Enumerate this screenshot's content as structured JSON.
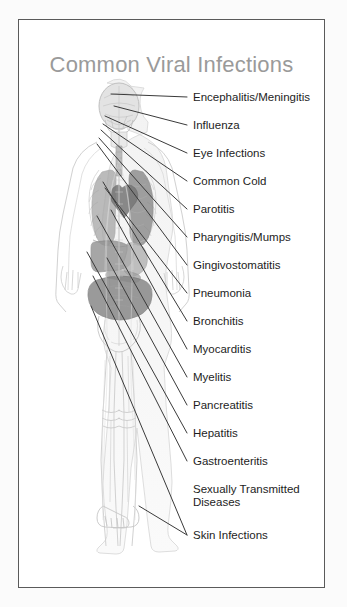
{
  "panel": {
    "title": "Common Viral Infections",
    "border_color": "#5a5a5a",
    "background": "#ffffff",
    "title_color": "#9a9a9a"
  },
  "figure": {
    "description_name": "human-anatomy-figure",
    "style": "semi-transparent grayscale anatomical body, front view, full length",
    "organ_fill": "#8f8f8f",
    "outline_color": "#cfcfcf",
    "skin_tint": "#ededed"
  },
  "leader_lines": {
    "color": "#3a3a3a",
    "width": 1
  },
  "labels": [
    {
      "id": "encephalitis-meningitis",
      "text": "Encephalitis/Meningitis",
      "y": 71,
      "anchor_x": 92,
      "anchor_y": 74,
      "has_leader": true
    },
    {
      "id": "influenza",
      "text": "Influenza",
      "y": 99,
      "anchor_x": 95,
      "anchor_y": 86,
      "has_leader": true
    },
    {
      "id": "eye-infections",
      "text": "Eye Infections",
      "y": 127,
      "anchor_x": 86,
      "anchor_y": 96,
      "has_leader": true
    },
    {
      "id": "common-cold",
      "text": "Common Cold",
      "y": 155,
      "anchor_x": 84,
      "anchor_y": 104,
      "has_leader": true
    },
    {
      "id": "parotitis",
      "text": "Parotitis",
      "y": 183,
      "anchor_x": 82,
      "anchor_y": 110,
      "has_leader": true
    },
    {
      "id": "pharyngitis-mumps",
      "text": "Pharyngitis/Mumps",
      "y": 211,
      "anchor_x": 80,
      "anchor_y": 118,
      "has_leader": true
    },
    {
      "id": "gingivostomatitis",
      "text": "Gingivostomatitis",
      "y": 239,
      "anchor_x": 78,
      "anchor_y": 124,
      "has_leader": true
    },
    {
      "id": "pneumonia",
      "text": "Pneumonia",
      "y": 267,
      "anchor_x": 86,
      "anchor_y": 168,
      "has_leader": true
    },
    {
      "id": "bronchitis",
      "text": "Bronchitis",
      "y": 295,
      "anchor_x": 84,
      "anchor_y": 162,
      "has_leader": true
    },
    {
      "id": "myocarditis",
      "text": "Myocarditis",
      "y": 323,
      "anchor_x": 92,
      "anchor_y": 190,
      "has_leader": true
    },
    {
      "id": "myelitis",
      "text": "Myelitis",
      "y": 351,
      "anchor_x": 78,
      "anchor_y": 196,
      "has_leader": true
    },
    {
      "id": "pancreatitis",
      "text": "Pancreatitis",
      "y": 379,
      "anchor_x": 88,
      "anchor_y": 238,
      "has_leader": true
    },
    {
      "id": "hepatitis",
      "text": "Hepatitis",
      "y": 407,
      "anchor_x": 68,
      "anchor_y": 232,
      "has_leader": true
    },
    {
      "id": "gastroenteritis",
      "text": "Gastroenteritis",
      "y": 435,
      "anchor_x": 74,
      "anchor_y": 256,
      "has_leader": true
    },
    {
      "id": "sexually-transmitted-diseases",
      "text": "Sexually Transmitted\nDiseases",
      "y": 463,
      "anchor_x": 0,
      "anchor_y": 0,
      "has_leader": false
    },
    {
      "id": "skin-infections",
      "text": "Skin Infections",
      "y": 509,
      "anchor_x": 72,
      "anchor_y": 286,
      "has_leader": true,
      "extra_anchor_x": 120,
      "extra_anchor_y": 486
    }
  ]
}
